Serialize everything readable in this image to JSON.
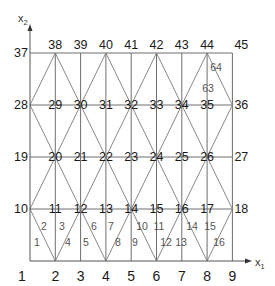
{
  "diagram": {
    "axes": {
      "x_label": "x",
      "x_subscript": "1",
      "y_label": "x",
      "y_subscript": "2"
    },
    "grid": {
      "columns": 9,
      "rows": 5,
      "col_x": [
        30,
        55.3,
        80.6,
        105.9,
        131.2,
        156.5,
        181.8,
        207.1,
        232.4
      ],
      "row_y": [
        261,
        209,
        157,
        105,
        53
      ]
    },
    "nodes": [
      {
        "id": "1",
        "col": 0,
        "row": 0
      },
      {
        "id": "2",
        "col": 1,
        "row": 0
      },
      {
        "id": "3",
        "col": 2,
        "row": 0
      },
      {
        "id": "4",
        "col": 3,
        "row": 0
      },
      {
        "id": "5",
        "col": 4,
        "row": 0
      },
      {
        "id": "6",
        "col": 5,
        "row": 0
      },
      {
        "id": "7",
        "col": 6,
        "row": 0
      },
      {
        "id": "8",
        "col": 7,
        "row": 0
      },
      {
        "id": "9",
        "col": 8,
        "row": 0
      },
      {
        "id": "10",
        "col": 0,
        "row": 1
      },
      {
        "id": "11",
        "col": 1,
        "row": 1
      },
      {
        "id": "12",
        "col": 2,
        "row": 1
      },
      {
        "id": "13",
        "col": 3,
        "row": 1
      },
      {
        "id": "14",
        "col": 4,
        "row": 1
      },
      {
        "id": "15",
        "col": 5,
        "row": 1
      },
      {
        "id": "16",
        "col": 6,
        "row": 1
      },
      {
        "id": "17",
        "col": 7,
        "row": 1
      },
      {
        "id": "18",
        "col": 8,
        "row": 1
      },
      {
        "id": "19",
        "col": 0,
        "row": 2
      },
      {
        "id": "20",
        "col": 1,
        "row": 2
      },
      {
        "id": "21",
        "col": 2,
        "row": 2
      },
      {
        "id": "22",
        "col": 3,
        "row": 2
      },
      {
        "id": "23",
        "col": 4,
        "row": 2
      },
      {
        "id": "24",
        "col": 5,
        "row": 2
      },
      {
        "id": "25",
        "col": 6,
        "row": 2
      },
      {
        "id": "26",
        "col": 7,
        "row": 2
      },
      {
        "id": "27",
        "col": 8,
        "row": 2
      },
      {
        "id": "28",
        "col": 0,
        "row": 3
      },
      {
        "id": "29",
        "col": 1,
        "row": 3
      },
      {
        "id": "30",
        "col": 2,
        "row": 3
      },
      {
        "id": "31",
        "col": 3,
        "row": 3
      },
      {
        "id": "32",
        "col": 4,
        "row": 3
      },
      {
        "id": "33",
        "col": 5,
        "row": 3
      },
      {
        "id": "34",
        "col": 6,
        "row": 3
      },
      {
        "id": "35",
        "col": 7,
        "row": 3
      },
      {
        "id": "36",
        "col": 8,
        "row": 3
      },
      {
        "id": "37",
        "col": 0,
        "row": 4
      },
      {
        "id": "38",
        "col": 1,
        "row": 4
      },
      {
        "id": "39",
        "col": 2,
        "row": 4
      },
      {
        "id": "40",
        "col": 3,
        "row": 4
      },
      {
        "id": "41",
        "col": 4,
        "row": 4
      },
      {
        "id": "42",
        "col": 5,
        "row": 4
      },
      {
        "id": "43",
        "col": 6,
        "row": 4
      },
      {
        "id": "44",
        "col": 7,
        "row": 4
      },
      {
        "id": "45",
        "col": 8,
        "row": 4
      }
    ],
    "diagonals": [
      [
        "2",
        "10"
      ],
      [
        "2",
        "12"
      ],
      [
        "4",
        "12"
      ],
      [
        "4",
        "14"
      ],
      [
        "6",
        "14"
      ],
      [
        "6",
        "16"
      ],
      [
        "8",
        "16"
      ],
      [
        "8",
        "18"
      ],
      [
        "10",
        "20"
      ],
      [
        "12",
        "20"
      ],
      [
        "12",
        "22"
      ],
      [
        "14",
        "22"
      ],
      [
        "14",
        "24"
      ],
      [
        "16",
        "24"
      ],
      [
        "16",
        "26"
      ],
      [
        "18",
        "26"
      ],
      [
        "20",
        "28"
      ],
      [
        "20",
        "30"
      ],
      [
        "22",
        "30"
      ],
      [
        "22",
        "32"
      ],
      [
        "24",
        "32"
      ],
      [
        "24",
        "34"
      ],
      [
        "26",
        "34"
      ],
      [
        "26",
        "36"
      ],
      [
        "28",
        "38"
      ],
      [
        "30",
        "38"
      ],
      [
        "30",
        "40"
      ],
      [
        "32",
        "40"
      ],
      [
        "32",
        "42"
      ],
      [
        "34",
        "42"
      ],
      [
        "34",
        "44"
      ],
      [
        "36",
        "44"
      ]
    ],
    "elements": [
      {
        "id": "1",
        "x": 37,
        "y": 246
      },
      {
        "id": "2",
        "x": 44,
        "y": 230
      },
      {
        "id": "3",
        "x": 62,
        "y": 230
      },
      {
        "id": "4",
        "x": 68,
        "y": 246
      },
      {
        "id": "5",
        "x": 86,
        "y": 246
      },
      {
        "id": "6",
        "x": 94,
        "y": 230
      },
      {
        "id": "7",
        "x": 111,
        "y": 230
      },
      {
        "id": "8",
        "x": 118,
        "y": 246
      },
      {
        "id": "9",
        "x": 135,
        "y": 246
      },
      {
        "id": "10",
        "x": 142,
        "y": 230
      },
      {
        "id": "11",
        "x": 159,
        "y": 230
      },
      {
        "id": "12",
        "x": 166,
        "y": 246
      },
      {
        "id": "13",
        "x": 181,
        "y": 246
      },
      {
        "id": "14",
        "x": 192,
        "y": 230
      },
      {
        "id": "15",
        "x": 210,
        "y": 230
      },
      {
        "id": "16",
        "x": 219,
        "y": 246
      },
      {
        "id": "63",
        "x": 208,
        "y": 92
      },
      {
        "id": "64",
        "x": 216,
        "y": 71
      }
    ]
  }
}
